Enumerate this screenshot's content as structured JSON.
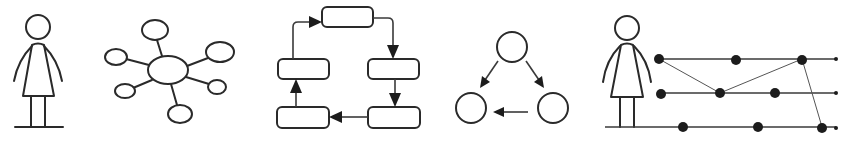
{
  "figure": {
    "panels": [
      {
        "id": "person",
        "description": "Single person figure standing on ground line"
      },
      {
        "id": "hub-network",
        "description": "Central node connected to six satellite nodes",
        "satellite_count": 6
      },
      {
        "id": "cycle",
        "description": "Five rounded boxes connected clockwise in a loop with arrows",
        "box_count": 5
      },
      {
        "id": "triangle-flow",
        "description": "Three circles: top points to bottom-left and bottom-right; bottom-right points to bottom-left",
        "node_count": 3
      },
      {
        "id": "person-timelines",
        "description": "Person figure beside three horizontal timelines with event dots linked by thin lines",
        "timeline_count": 3,
        "events_per_line": [
          3,
          3,
          3
        ]
      }
    ],
    "colors": {
      "stroke": "#2a2a2a",
      "dot": "#1c1c1c",
      "background": "#ffffff"
    }
  }
}
